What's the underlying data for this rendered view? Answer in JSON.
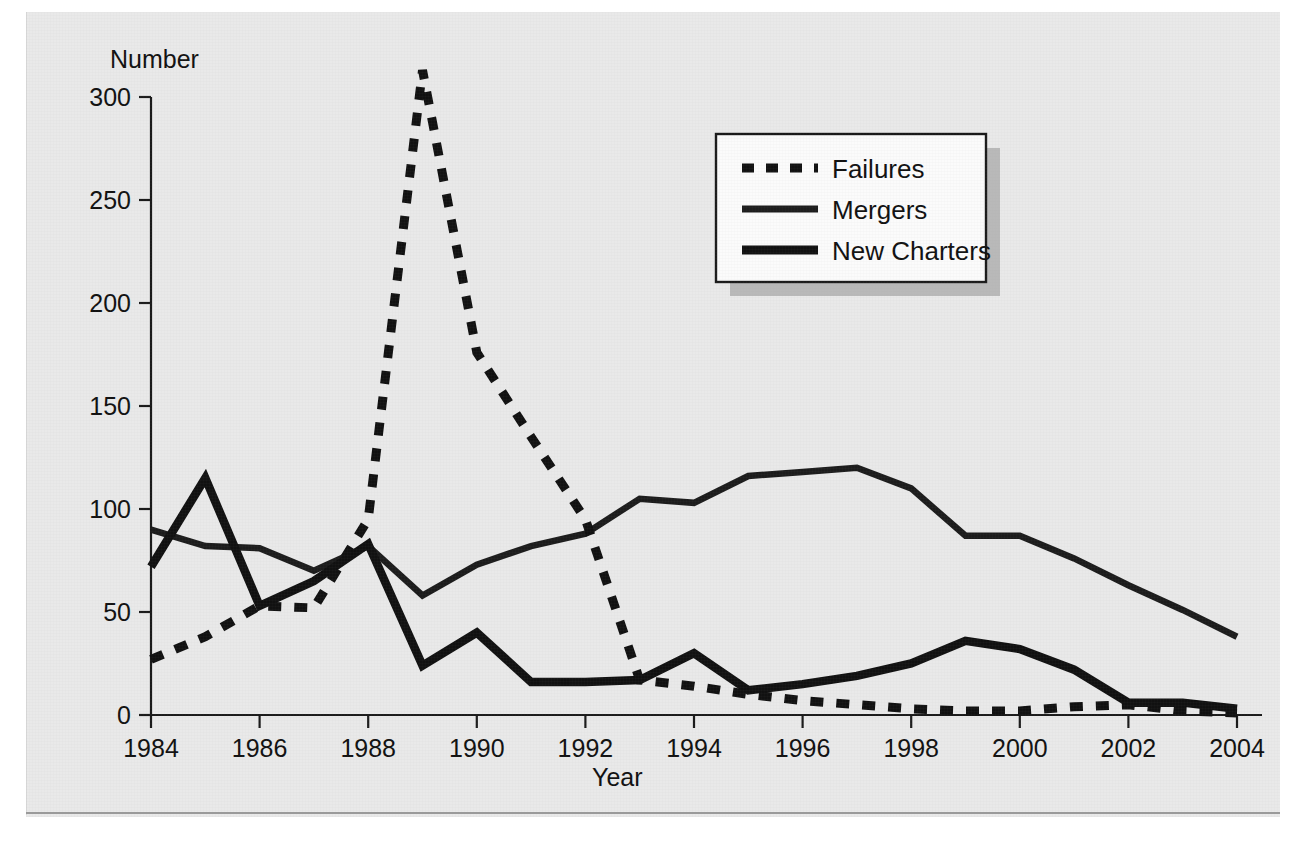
{
  "chart_data": {
    "type": "line",
    "title": "",
    "xlabel": "Year",
    "ylabel": "Number",
    "xlim": [
      1984,
      2004
    ],
    "ylim": [
      0,
      320
    ],
    "grid": false,
    "legend_position": "top-right",
    "x": [
      1984,
      1985,
      1986,
      1987,
      1988,
      1989,
      1990,
      1991,
      1992,
      1993,
      1994,
      1995,
      1996,
      1997,
      1998,
      1999,
      2000,
      2001,
      2002,
      2003,
      2004
    ],
    "xticks": [
      "1984",
      "1986",
      "1988",
      "1990",
      "1992",
      "1994",
      "1996",
      "1998",
      "2000",
      "2002",
      "2004"
    ],
    "xtick_values": [
      1984,
      1986,
      1988,
      1990,
      1992,
      1994,
      1996,
      1998,
      2000,
      2002,
      2004
    ],
    "yticks": [
      "0",
      "50",
      "100",
      "150",
      "200",
      "250",
      "300"
    ],
    "ytick_values": [
      0,
      50,
      100,
      150,
      200,
      250,
      300
    ],
    "series": [
      {
        "name": "Failures",
        "style": "dotted",
        "values": [
          27,
          38,
          53,
          52,
          95,
          313,
          176,
          135,
          95,
          17,
          14,
          10,
          7,
          5,
          3,
          2,
          2,
          4,
          5,
          2,
          1
        ]
      },
      {
        "name": "Mergers",
        "style": "solid-medium",
        "values": [
          90,
          82,
          81,
          70,
          82,
          58,
          73,
          82,
          88,
          105,
          103,
          116,
          118,
          120,
          110,
          87,
          87,
          76,
          63,
          51,
          38
        ]
      },
      {
        "name": "New Charters",
        "style": "solid-thick",
        "values": [
          72,
          115,
          53,
          65,
          83,
          24,
          40,
          16,
          16,
          17,
          30,
          12,
          15,
          19,
          25,
          36,
          32,
          22,
          6,
          6,
          3
        ]
      }
    ]
  },
  "axes": {
    "ylabel": "Number",
    "xlabel": "Year"
  },
  "legend": {
    "items": [
      {
        "label": "Failures"
      },
      {
        "label": "Mergers"
      },
      {
        "label": "New Charters"
      }
    ]
  }
}
